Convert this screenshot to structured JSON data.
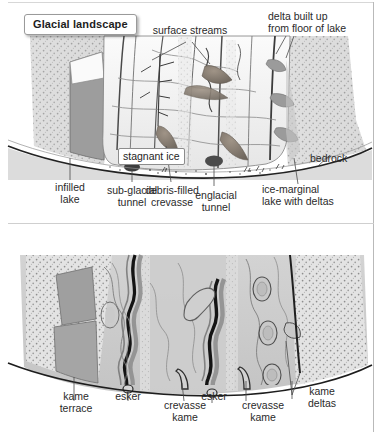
{
  "figure": {
    "panel_count": 2,
    "colors": {
      "page_background": "#ffffff",
      "hillside_stipple": "#b6b6b6",
      "lake_water": "#9a9a9a",
      "ice_surface": "#f2f2f2",
      "outwash_plain": "#d9d9d9",
      "debris_brown": "#8d8378",
      "esker_dark": "#1a1a1a",
      "label_text": "#2a2a2a",
      "frame_line": "#b9b9b9"
    }
  },
  "panels": [
    {
      "id": "glacial",
      "title": "Glacial landscape",
      "labels": [
        {
          "name": "surface-streams",
          "text": "surface streams"
        },
        {
          "name": "delta-built-up",
          "line1": "delta built up",
          "line2": "from floor of lake"
        },
        {
          "name": "stagnant-ice",
          "text": "stagnant ice"
        },
        {
          "name": "bedrock",
          "text": "bedrock"
        },
        {
          "name": "infilled-lake",
          "line1": "infilled",
          "line2": "lake"
        },
        {
          "name": "sub-glacial-tunnel",
          "line1": "sub-glacial",
          "line2": "tunnel"
        },
        {
          "name": "debris-filled-crevasse",
          "line1": "debris-filled",
          "line2": "crevasse"
        },
        {
          "name": "englacial-tunnel",
          "line1": "englacial",
          "line2": "tunnel"
        },
        {
          "name": "ice-marginal-lake",
          "line1": "ice-marginal",
          "line2": "lake with deltas"
        }
      ]
    },
    {
      "id": "postglacial",
      "title": "Postglacial landscape",
      "labels": [
        {
          "name": "kame-terrace",
          "line1": "kame",
          "line2": "terrace"
        },
        {
          "name": "esker-left",
          "text": "esker"
        },
        {
          "name": "crevasse-kame-left",
          "line1": "crevasse",
          "line2": "kame"
        },
        {
          "name": "esker-right",
          "text": "esker"
        },
        {
          "name": "crevasse-kame-right",
          "line1": "crevasse",
          "line2": "kame"
        },
        {
          "name": "kame-deltas",
          "line1": "kame",
          "line2": "deltas"
        }
      ]
    }
  ]
}
